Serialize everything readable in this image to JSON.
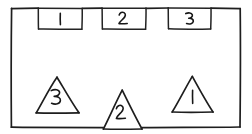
{
  "diagram": {
    "title": "Hand-drawn diagram: rectangle with numbered squares and triangles",
    "style": "hand-drawn pencil sketch",
    "background_color": "#ffffff",
    "ink_color": "#1e1e1e",
    "container": {
      "name": "outer rectangle",
      "shape": "rectangle",
      "x": 11,
      "y": 8,
      "width": 229,
      "height": 119
    },
    "squares": [
      {
        "label": "1",
        "shape": "square",
        "position": "top edge, left",
        "x": 38,
        "y": 8,
        "width": 44,
        "height": 21
      },
      {
        "label": "2",
        "shape": "square",
        "position": "top edge, center",
        "x": 102,
        "y": 8,
        "width": 44,
        "height": 21
      },
      {
        "label": "3",
        "shape": "square",
        "position": "top edge, right",
        "x": 168,
        "y": 8,
        "width": 43,
        "height": 21
      }
    ],
    "triangles": [
      {
        "label": "3",
        "shape": "triangle",
        "position": "bottom area, left",
        "apex_x": 57,
        "apex_y": 77,
        "base_left_x": 36,
        "base_right_x": 79,
        "base_y": 113
      },
      {
        "label": "2",
        "shape": "triangle",
        "position": "bottom edge, center",
        "apex_x": 122,
        "apex_y": 90,
        "base_left_x": 103,
        "base_right_x": 142,
        "base_y": 129
      },
      {
        "label": "1",
        "shape": "triangle",
        "position": "bottom area, right",
        "apex_x": 192,
        "apex_y": 76,
        "base_left_x": 172,
        "base_right_x": 213,
        "base_y": 112
      }
    ]
  }
}
